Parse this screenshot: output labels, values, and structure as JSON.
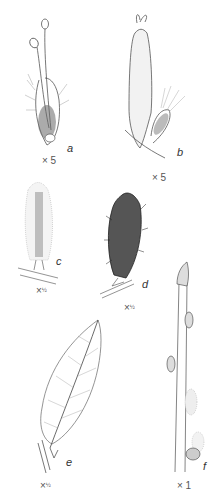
{
  "plate": {
    "figures": [
      {
        "id": "a",
        "letter": "a",
        "scale": "× 5",
        "description": "male flower with two stamens and hairy bract"
      },
      {
        "id": "b",
        "letter": "b",
        "scale": "× 5",
        "description": "female flower with elongated ovary, bifid stigma and bract"
      },
      {
        "id": "c",
        "letter": "c",
        "scale": "×",
        "scale_frac": "½",
        "description": "female catkin on twig"
      },
      {
        "id": "d",
        "letter": "d",
        "scale": "×",
        "scale_frac": "½",
        "description": "male catkin, dense and hairy, on twig"
      },
      {
        "id": "e",
        "letter": "e",
        "scale": "×",
        "scale_frac": "½",
        "description": "elliptic leaf with pinnate venation on twig"
      },
      {
        "id": "f",
        "letter": "f",
        "scale": "× 1",
        "description": "twig with buds"
      }
    ]
  }
}
